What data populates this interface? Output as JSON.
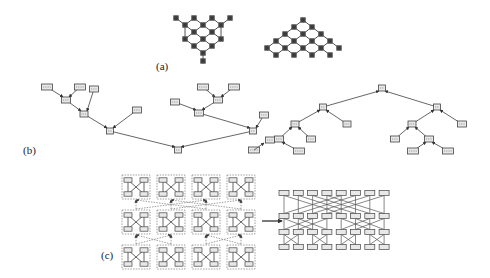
{
  "figure": {
    "panels": [
      {
        "id": "a",
        "label": "(a)",
        "description": "Two diamond lattice graphs: left is an inverted triangle (V-shaped) lattice, right is an upright triangle lattice"
      },
      {
        "id": "b",
        "label": "(b)",
        "description": "Two binary trees of labeled boxes: left tree is a skewed/unbalanced tree grown from a root at the bottom, right tree is a balanced tree with root at top"
      },
      {
        "id": "c",
        "label": "(c)",
        "description": "A 3x4 grid of dashed modules each containing a butterfly (X) connection, mapped via an arrow to an expanded butterfly network of 4 rows by 8 columns"
      }
    ]
  },
  "colors": {
    "node": "#3a3a3a",
    "edge": "#555555",
    "box_fill": "#e8e8e8",
    "box_stroke": "#444444",
    "dashed": "#888888"
  }
}
